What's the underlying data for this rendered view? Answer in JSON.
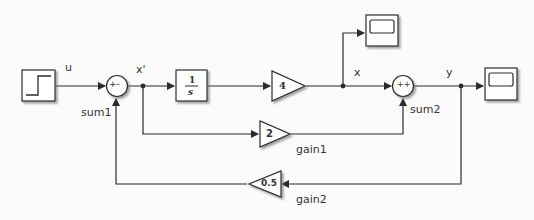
{
  "diagram": {
    "type": "simulink-block-diagram",
    "blocks": {
      "step": {
        "name": "step",
        "icon": "step-icon"
      },
      "sum1": {
        "name": "sum1",
        "signs": "+-"
      },
      "integrator": {
        "num": "1",
        "den": "s"
      },
      "gain4": {
        "value": "4"
      },
      "scope_x": {
        "name": "scope",
        "icon": "scope-icon"
      },
      "sum2": {
        "name": "sum2",
        "signs": "++"
      },
      "scope_y": {
        "name": "scope",
        "icon": "scope-icon"
      },
      "gain1": {
        "name": "gain1",
        "value": "2"
      },
      "gain2": {
        "name": "gain2",
        "value": "0.5"
      }
    },
    "signals": {
      "u": "u",
      "xprime": "x'",
      "x": "x",
      "y": "y"
    },
    "colors": {
      "line": "#2b2b2b",
      "block_fill": "#ffffff",
      "shadow": "#9a9a9a",
      "background": "#fbfbfb"
    }
  }
}
